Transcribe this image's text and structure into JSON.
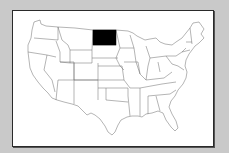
{
  "map": {
    "type": "choropleth",
    "region": "United States (contiguous)",
    "highlighted_state": "North Dakota",
    "colors": {
      "background": "#c9c9c9",
      "panel": "#ffffff",
      "state_fill": "#ffffff",
      "state_border": "#6a6a6a",
      "highlight_fill": "#000000"
    }
  }
}
